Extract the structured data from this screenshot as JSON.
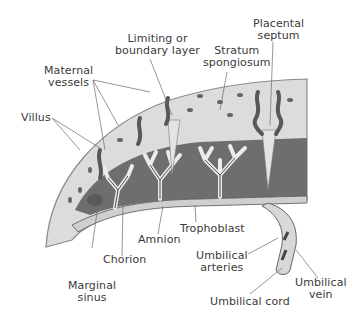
{
  "diagram": {
    "type": "anatomical-cross-section",
    "subject": "placenta",
    "colors": {
      "background": "#ffffff",
      "decidua": "#dcdcdc",
      "decidua_outline": "#8a8a8a",
      "intervillous_space": "#6e6e6e",
      "villus": "#d6d6d6",
      "vessel": "#585858",
      "label_text": "#3a3a3a",
      "leader_line": "#6a6a6a"
    },
    "labels": {
      "maternal_vessels": [
        "Maternal",
        "vessels"
      ],
      "limiting_layer": [
        "Limiting or",
        "boundary layer"
      ],
      "stratum_spongiosum": [
        "Stratum",
        "spongiosum"
      ],
      "placental_septum": [
        "Placental",
        "septum"
      ],
      "villus": [
        "Villus"
      ],
      "amnion": [
        "Amnion"
      ],
      "chorion": [
        "Chorion"
      ],
      "marginal_sinus": [
        "Marginal",
        "sinus"
      ],
      "trophoblast": [
        "Trophoblast"
      ],
      "umbilical_arteries": [
        "Umbilical",
        "arteries"
      ],
      "umbilical_vein": [
        "Umbilical",
        "vein"
      ],
      "umbilical_cord": [
        "Umbilical cord"
      ]
    }
  }
}
